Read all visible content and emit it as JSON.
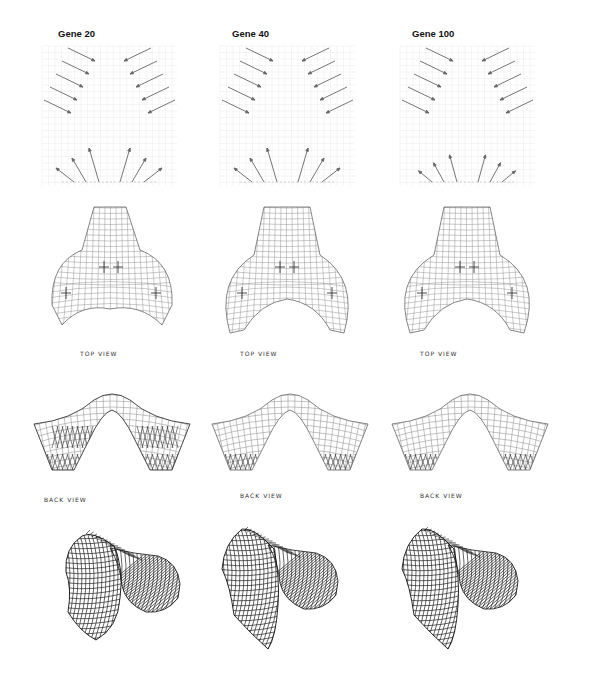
{
  "figure": {
    "columns": [
      {
        "title": "Gene 20",
        "top_label": "TOP VIEW",
        "back_label": "BACK VIEW"
      },
      {
        "title": "Gene 40",
        "top_label": "TOP VIEW",
        "back_label": "BACK VIEW"
      },
      {
        "title": "Gene 100",
        "top_label": "TOP VIEW",
        "back_label": "BACK VIEW"
      }
    ],
    "rows": [
      "force-vector-diagram",
      "top-view",
      "back-view",
      "perspective-view"
    ],
    "colors": {
      "arrow": "#666666",
      "grid": "#e6e6e6",
      "mesh_light": "#9a9a9a",
      "mesh_dark": "#222222"
    }
  }
}
